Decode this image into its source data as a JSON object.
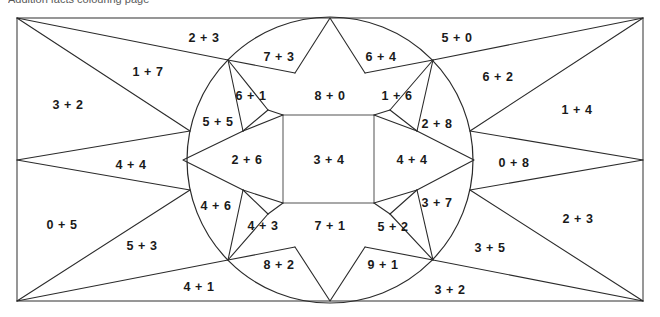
{
  "figure": {
    "title_clipped": "Addition facts colouring page",
    "geometry": {
      "canvas_width": 660,
      "canvas_height": 317,
      "rect_left": 17,
      "rect_top": 18,
      "rect_right": 643,
      "rect_bottom": 301,
      "circle_cx": 330,
      "circle_cy": 160,
      "circle_r": 143,
      "square_left": 283,
      "square_top": 115,
      "square_right": 374,
      "square_bottom": 203
    },
    "stroke_color": "#2b2b2b",
    "frame_color": "#6b6b6b",
    "background_color": "#ffffff",
    "label_color": "#1a1a1a"
  },
  "regions": [
    {
      "name": "outer-left-middle",
      "text": "3 + 2",
      "x": 68,
      "y": 105
    },
    {
      "name": "outer-top-left-inner",
      "text": "1 + 7",
      "x": 148,
      "y": 72
    },
    {
      "name": "outer-top-left-arc",
      "text": "2 + 3",
      "x": 204,
      "y": 38
    },
    {
      "name": "outer-left-lower-wedge",
      "text": "4 + 4",
      "x": 131,
      "y": 165
    },
    {
      "name": "outer-bottom-left",
      "text": "0 + 5",
      "x": 62,
      "y": 225
    },
    {
      "name": "outer-bottom-left-inner",
      "text": "5 + 3",
      "x": 142,
      "y": 246
    },
    {
      "name": "outer-bottom-left-arc",
      "text": "4 + 1",
      "x": 199,
      "y": 287
    },
    {
      "name": "outer-top-right-arc",
      "text": "5 + 0",
      "x": 457,
      "y": 38
    },
    {
      "name": "outer-top-right-inner",
      "text": "6 + 2",
      "x": 498,
      "y": 77
    },
    {
      "name": "outer-right-upper",
      "text": "1 + 4",
      "x": 577,
      "y": 110
    },
    {
      "name": "outer-right-wedge",
      "text": "0 + 8",
      "x": 514,
      "y": 163
    },
    {
      "name": "outer-right-lower",
      "text": "2 + 3",
      "x": 578,
      "y": 219
    },
    {
      "name": "outer-bottom-right-inner",
      "text": "3 + 5",
      "x": 490,
      "y": 248
    },
    {
      "name": "outer-bottom-right-arc",
      "text": "3 + 2",
      "x": 450,
      "y": 290
    },
    {
      "name": "star-top-left-point",
      "text": "7 + 3",
      "x": 279,
      "y": 57
    },
    {
      "name": "star-top-right-point",
      "text": "6 + 4",
      "x": 381,
      "y": 57
    },
    {
      "name": "star-top-point",
      "text": "8 + 0",
      "x": 330,
      "y": 96
    },
    {
      "name": "inner-upper-left-small",
      "text": "6 + 1",
      "x": 251,
      "y": 96
    },
    {
      "name": "inner-left-upper",
      "text": "5 + 5",
      "x": 218,
      "y": 122
    },
    {
      "name": "star-left-point",
      "text": "2 + 6",
      "x": 247,
      "y": 160
    },
    {
      "name": "center-square",
      "text": "3 + 4",
      "x": 329,
      "y": 160
    },
    {
      "name": "star-right-point",
      "text": "4 + 4",
      "x": 412,
      "y": 160
    },
    {
      "name": "inner-upper-right-small",
      "text": "1 + 6",
      "x": 397,
      "y": 96
    },
    {
      "name": "inner-right-upper",
      "text": "2 + 8",
      "x": 437,
      "y": 124
    },
    {
      "name": "inner-left-lower",
      "text": "4 + 6",
      "x": 216,
      "y": 206
    },
    {
      "name": "inner-lower-left-small",
      "text": "4 + 3",
      "x": 263,
      "y": 226
    },
    {
      "name": "star-bottom-left-point",
      "text": "8 + 2",
      "x": 279,
      "y": 265
    },
    {
      "name": "star-bottom-point",
      "text": "7 + 1",
      "x": 330,
      "y": 226
    },
    {
      "name": "inner-lower-right-small",
      "text": "5 + 2",
      "x": 393,
      "y": 227
    },
    {
      "name": "star-bottom-right-point",
      "text": "9 + 1",
      "x": 383,
      "y": 265
    },
    {
      "name": "inner-right-lower",
      "text": "3 + 7",
      "x": 437,
      "y": 203
    }
  ]
}
